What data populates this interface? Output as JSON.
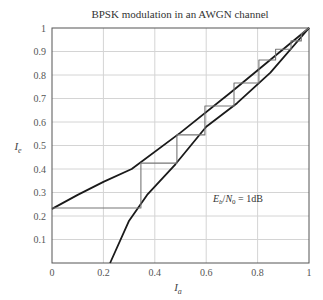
{
  "chart_data": {
    "type": "line",
    "title": "BPSK modulation in an AWGN channel",
    "xlabel": "I_a",
    "ylabel": "I_e",
    "xlim": [
      0,
      1
    ],
    "ylim": [
      0,
      1
    ],
    "grid": true,
    "xticks": [
      "0",
      "0.2",
      "0.4",
      "0.6",
      "0.8",
      "1"
    ],
    "yticks": [
      "0.1",
      "0.2",
      "0.3",
      "0.4",
      "0.5",
      "0.6",
      "0.7",
      "0.8",
      "0.9",
      "1"
    ],
    "annotation": {
      "text": "E_b/N_0 = 1dB",
      "x": 0.63,
      "y": 0.27
    },
    "series": [
      {
        "name": "Decoder 1 transfer characteristic",
        "x": [
          0,
          0.1,
          0.2,
          0.31,
          0.5,
          0.7,
          0.85,
          1
        ],
        "y": [
          0.23,
          0.29,
          0.345,
          0.4,
          0.555,
          0.73,
          0.865,
          1
        ]
      },
      {
        "name": "Decoder 2 transfer characteristic (inverted)",
        "x": [
          0.226,
          0.3,
          0.37,
          0.48,
          0.6,
          0.72,
          0.85,
          1
        ],
        "y": [
          0,
          0.18,
          0.29,
          0.42,
          0.58,
          0.68,
          0.81,
          1
        ]
      },
      {
        "name": "Decoding trajectory",
        "x": [
          0,
          0.346,
          0.346,
          0.486,
          0.486,
          0.595,
          0.595,
          0.708,
          0.708,
          0.805,
          0.805,
          0.87,
          0.87,
          0.93,
          0.93,
          0.97,
          0.97,
          1
        ],
        "y": [
          0.234,
          0.234,
          0.425,
          0.425,
          0.545,
          0.545,
          0.668,
          0.668,
          0.766,
          0.766,
          0.864,
          0.864,
          0.91,
          0.91,
          0.945,
          0.945,
          0.975,
          1
        ]
      }
    ]
  }
}
